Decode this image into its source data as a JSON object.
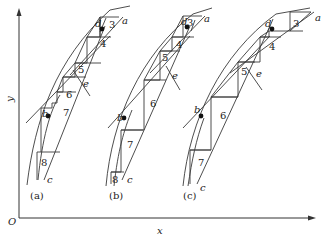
{
  "figure": {
    "axes": {
      "x_label": "x",
      "y_label": "y",
      "origin_label": "O"
    },
    "panels": [
      {
        "caption": "(a)",
        "points": {
          "a": "a",
          "b": "b",
          "c": "c",
          "d": "d",
          "e": "e"
        },
        "steps": [
          "3",
          "4",
          "5",
          "6",
          "7",
          "8"
        ]
      },
      {
        "caption": "(b)",
        "points": {
          "a": "a",
          "b": "b",
          "c": "c",
          "d": "d",
          "e": "e"
        },
        "steps": [
          "3",
          "4",
          "5",
          "6",
          "7",
          "8"
        ]
      },
      {
        "caption": "(c)",
        "points": {
          "a": "a",
          "b": "b",
          "c": "c",
          "d": "d",
          "e": "e"
        },
        "steps": [
          "3",
          "4",
          "5",
          "6",
          "7"
        ]
      }
    ]
  }
}
